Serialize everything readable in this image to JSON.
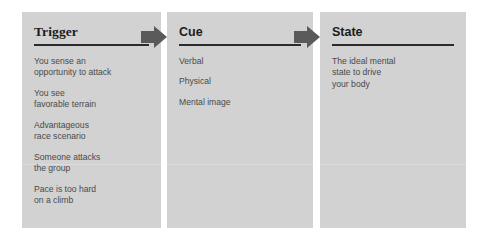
{
  "diagram": {
    "background_color": "#ffffff",
    "panel_color": "#d2d2d2",
    "arrow_color": "#5a5a5a",
    "rule_color": "#2b2b2b",
    "text_color": "#4a4a4a",
    "divider_color": "#dcdcdc",
    "columns": [
      {
        "id": "trigger",
        "header": "Trigger",
        "items": [
          "You sense an\nopportunity to attack",
          "You see\nfavorable terrain",
          "Advantageous\nrace scenario",
          "Someone attacks\nthe group",
          "Pace is too hard\non a climb"
        ]
      },
      {
        "id": "cue",
        "header": "Cue",
        "items": [
          "Verbal",
          "Physical",
          "Mental image"
        ]
      },
      {
        "id": "state",
        "header": "State",
        "items": [
          "The ideal mental\nstate to drive\nyour body"
        ]
      }
    ],
    "arrows": [
      {
        "id": "arrow-trigger-to-cue",
        "label": "right-arrow"
      },
      {
        "id": "arrow-cue-to-state",
        "label": "right-arrow"
      }
    ]
  }
}
